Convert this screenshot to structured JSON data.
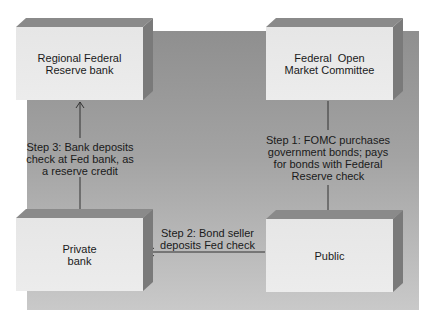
{
  "diagram": {
    "nodes": {
      "regional_fed": {
        "label_line1": "Regional Federal",
        "label_line2": "Reserve bank"
      },
      "fomc": {
        "label_line1": "Federal  Open",
        "label_line2": "Market Committee"
      },
      "private_bank": {
        "label_line1": "Private",
        "label_line2": "bank"
      },
      "public": {
        "label_line1": "Public"
      }
    },
    "steps": {
      "step1": {
        "line1": "Step 1: FOMC purchases",
        "line2": "government bonds; pays",
        "line3": "for bonds with Federal",
        "line4": "Reserve check"
      },
      "step2": {
        "line1": "Step 2: Bond seller",
        "line2": "deposits Fed check"
      },
      "step3": {
        "line1": "Step 3: Bank deposits",
        "line2": "check at Fed bank, as",
        "line3": "a reserve credit"
      }
    },
    "edges": [
      {
        "from": "fomc",
        "to": "public",
        "label": "step1"
      },
      {
        "from": "public",
        "to": "private_bank",
        "label": "step2"
      },
      {
        "from": "private_bank",
        "to": "regional_fed",
        "label": "step3"
      }
    ],
    "colors": {
      "panel_top": "#8f8f8f",
      "panel_bottom": "#c9c9c9",
      "box_face": "#e8e8e8",
      "box_top": "#8a8a8a",
      "box_side": "#7a7a7a",
      "line": "#333333"
    }
  }
}
